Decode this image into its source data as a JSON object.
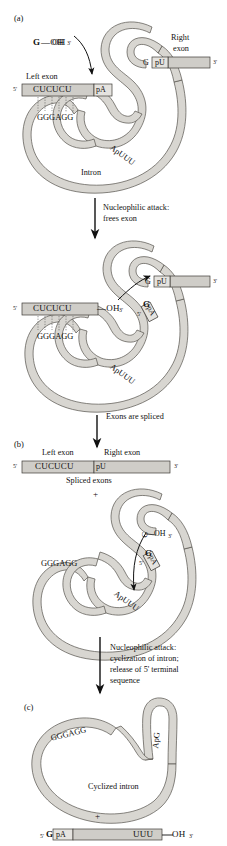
{
  "figure": {
    "background": "#ffffff",
    "ribbon_fill": "#d8d6d1",
    "ribbon_stroke": "#55524c",
    "exon_fill": "#cfcdc8",
    "exon_stroke": "#3c3ا9",
    "text_color": "#111111"
  },
  "panels": {
    "a": {
      "tag": "(a)",
      "nucleophile": {
        "base": "G",
        "bond": "—OH",
        "prime": "3'"
      },
      "left_exon_label": "Left exon",
      "right_exon_label_line1": "Right",
      "right_exon_label_line2": "exon",
      "five_prime": "5'",
      "three_prime": "3'",
      "left_exon_seq": "CUCUCU",
      "splice_site_5": "pA",
      "splice_site_3": "pU",
      "guanosine": "G",
      "intron_pair_seq": "GGGAGG",
      "branch_seq": "ApUUU",
      "intron_label": "Intron",
      "base_pairs": 6
    },
    "b": {
      "tag": "(b)",
      "left_exon_label": "Left exon",
      "right_exon_label": "Right exon",
      "five_prime": "5'",
      "three_prime": "3'",
      "spliced_seq_left": "CUCUCU",
      "spliced_seq_right": "pU",
      "spliced_caption": "Spliced exons",
      "plus": "+",
      "nucleophile": {
        "base": "G",
        "bond": "—OH",
        "prime": "3'"
      },
      "g_label": "G",
      "pa_label": "pA",
      "pa_prime": "5'",
      "intron_pair_seq": "GGGAGG",
      "branch_seq": "ApUUU"
    },
    "c": {
      "tag": "(c)",
      "intron_pair_seq": "GGGAGG",
      "branch_seq": "ApG",
      "cyclized_label": "Cyclized intron",
      "plus": "+",
      "tail_five_prime": "5'",
      "tail_g": "G",
      "tail_pa": "pA",
      "tail_uuu": "UUU",
      "tail_bond": "—OH",
      "tail_three_prime": "3'"
    }
  },
  "intermediate": {
    "free_exon_seq": "CUCUCU",
    "free_exon_bond": "—OH",
    "free_exon_prime": "3'",
    "five_prime": "5'",
    "three_prime": "3'",
    "guanosine": "G",
    "splice_site_3": "pU",
    "g_label": "G",
    "pa_label": "pA",
    "pa_prime": "5'",
    "intron_pair_seq": "GGGAGG",
    "branch_seq": "ApUUU"
  },
  "transitions": [
    {
      "id": "t1",
      "lines": [
        "Nucleophilic attack:",
        "frees exon"
      ]
    },
    {
      "id": "t2",
      "lines": [
        "Exons are spliced"
      ]
    },
    {
      "id": "t3",
      "lines": [
        "Nucleophilic attack:",
        "cyclization of intron;",
        "release of 5' terminal",
        "sequence"
      ]
    }
  ]
}
